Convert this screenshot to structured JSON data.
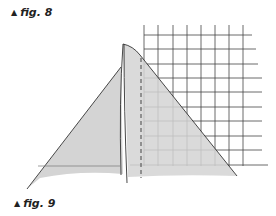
{
  "figures": [
    {
      "label": "fig. 8",
      "marker": "▲"
    },
    {
      "label": "fig. 9",
      "marker": "▲"
    }
  ],
  "diagram": {
    "fill_color": "#d4d4d4",
    "line_color": "#333333",
    "grid_color": "#444444"
  }
}
